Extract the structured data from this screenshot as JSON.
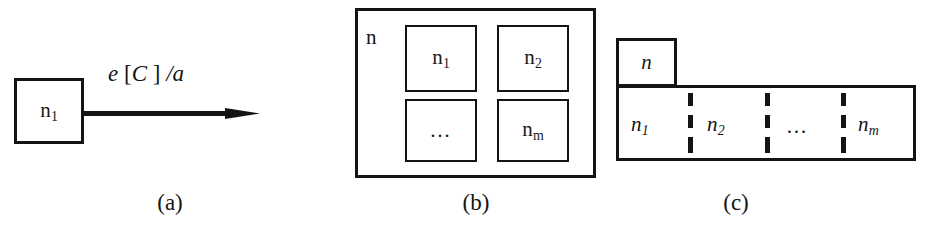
{
  "figure": {
    "background_color": "#ffffff",
    "line_color": "#141414",
    "panels": [
      {
        "id": "a",
        "caption": "(a)",
        "nodes": [
          {
            "name": "source-node",
            "label_base": "n",
            "label_sub": "1"
          },
          {
            "name": "target-node",
            "label_base": "n",
            "label_sub": "1"
          }
        ],
        "edge": {
          "name": "transition-arrow",
          "label_event": "e",
          "label_open_bracket": "[",
          "label_condition": "C",
          "label_close_bracket": "]",
          "label_slash_action": "/a",
          "label_full": "e [C ] /a"
        }
      },
      {
        "id": "b",
        "caption": "(b)",
        "outer_label": "n",
        "inner_nodes": [
          {
            "label_base": "n",
            "label_sub": "1"
          },
          {
            "label_base": "n",
            "label_sub": "2"
          },
          {
            "label_base": "…",
            "label_sub": ""
          },
          {
            "label_base": "n",
            "label_sub": "m"
          }
        ]
      },
      {
        "id": "c",
        "caption": "(c)",
        "tab_label": "n",
        "regions": [
          {
            "label_base": "n",
            "label_sub": "1"
          },
          {
            "label_base": "n",
            "label_sub": "2"
          },
          {
            "label_base": "…",
            "label_sub": ""
          },
          {
            "label_base": "n",
            "label_sub": "m"
          }
        ],
        "divider_count": 3,
        "divider_style": "dashed"
      }
    ]
  }
}
